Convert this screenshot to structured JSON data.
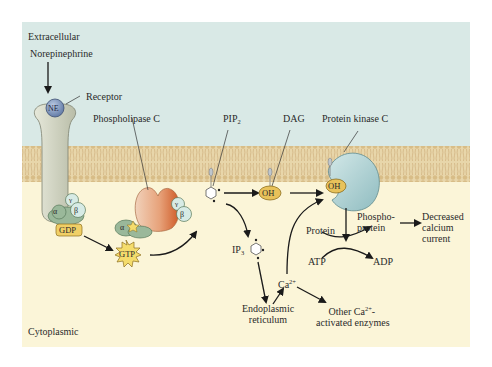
{
  "figure": {
    "regions": {
      "extracellular": "Extracellular",
      "cytoplasmic": "Cytoplasmic"
    },
    "colors": {
      "extracellular_bg": "#d9e9e6",
      "cytoplasm_bg": "#fbf5d8",
      "membrane": "#e6d3a6",
      "membrane_lines": "#c4a774",
      "receptor": "#d3d6c4",
      "g_alpha": "#9ab89a",
      "g_beta_gamma": "#d7ebe5",
      "gdp_box": "#f0cf66",
      "gtp_burst": "#f4dc6c",
      "plc_light": "#efc5a8",
      "plc_dark": "#d76a34",
      "pkc": "#b6d5d6",
      "oh_node": "#e8c25a",
      "ne_ball": "#7f98c0",
      "arrow": "#1a1a1a"
    },
    "labels": {
      "norepinephrine": "Norepinephrine",
      "ne": "NE",
      "receptor": "Receptor",
      "phospholipase_c": "Phospholipase C",
      "pip2_main": "PIP",
      "pip2_sub": "2",
      "dag": "DAG",
      "protein_kinase_c": "Protein kinase C",
      "alpha": "α",
      "beta": "β",
      "gamma": "γ",
      "gdp": "GDP",
      "gtp": "GTP",
      "oh": "OH",
      "ip3_main": "IP",
      "ip3_sub": "3",
      "ca_main": "Ca",
      "ca_sup": "2+",
      "endoplasmic_line1": "Endoplasmic",
      "endoplasmic_line2": "reticulum",
      "other_line1_main": "Other Ca",
      "other_line1_sup": "2+",
      "other_line1_end": "-",
      "other_line2": "activated enzymes",
      "protein": "Protein",
      "atp": "ATP",
      "adp": "ADP",
      "phosphoprotein_line1": "Phospho-",
      "phosphoprotein_line2": "protein",
      "decreased_line1": "Decreased",
      "decreased_line2": "calcium",
      "decreased_line3": "current"
    }
  }
}
